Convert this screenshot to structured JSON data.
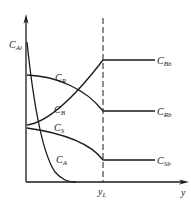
{
  "diagram": {
    "title": "",
    "axes": {
      "y_label": "C",
      "y_label_sub": "Ai",
      "x_label": "y"
    },
    "marker": {
      "label": "y",
      "label_sub": "L"
    },
    "curves": [
      {
        "name": "C",
        "sub": "R"
      },
      {
        "name": "C",
        "sub": "B"
      },
      {
        "name": "C",
        "sub": "S"
      },
      {
        "name": "C",
        "sub": "A"
      }
    ],
    "bulk_labels": [
      {
        "name": "C",
        "sub": "Bb"
      },
      {
        "name": "C",
        "sub": "Rb"
      },
      {
        "name": "C",
        "sub": "Sb"
      }
    ],
    "colors": {
      "line": "#1a1a1a",
      "background": "#ffffff"
    }
  }
}
